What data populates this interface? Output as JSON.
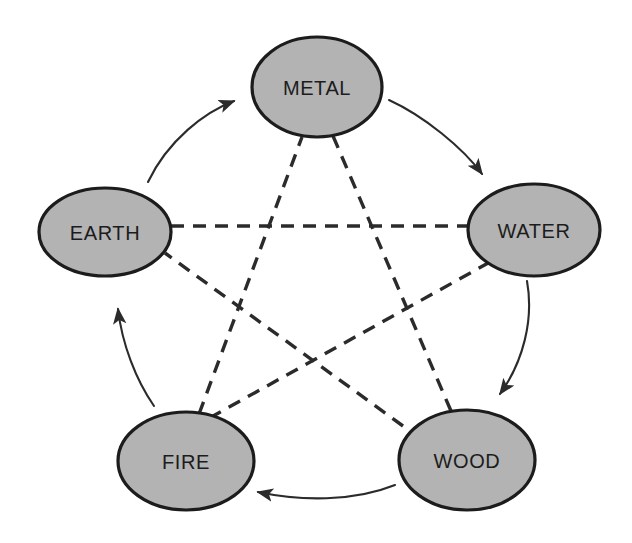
{
  "diagram": {
    "background_color": "#ffffff",
    "node_fill_color": "#b3b3b3",
    "node_stroke_color": "#1c1c1c",
    "label_color": "#1c1c1c",
    "arrow_color": "#2b2b2b",
    "dashed_line_color": "#2b2b2b",
    "dash_pattern": "13 9",
    "nodes": [
      {
        "id": "metal",
        "label": "METAL",
        "cx": 317,
        "cy": 87,
        "rx": 65,
        "ry": 50
      },
      {
        "id": "water",
        "label": "WATER",
        "cx": 534,
        "cy": 230,
        "rx": 66,
        "ry": 46
      },
      {
        "id": "wood",
        "label": "WOOD",
        "cx": 467,
        "cy": 460,
        "rx": 68,
        "ry": 50
      },
      {
        "id": "fire",
        "label": "FIRE",
        "cx": 186,
        "cy": 461,
        "rx": 68,
        "ry": 49
      },
      {
        "id": "earth",
        "label": "EARTH",
        "cx": 105,
        "cy": 232,
        "rx": 66,
        "ry": 44
      }
    ],
    "generating_cycle": {
      "name": "generating cycle",
      "style": "solid curved arrow",
      "edges": [
        {
          "id": "earth-metal",
          "from": "EARTH",
          "to": "METAL",
          "path": "M 148 182 C 168 140 205 112 234 101"
        },
        {
          "id": "metal-water",
          "from": "METAL",
          "to": "WATER",
          "path": "M 389 100 C 424 116 463 148 482 174"
        },
        {
          "id": "water-wood",
          "from": "WATER",
          "to": "WOOD",
          "path": "M 527 281 C 534 320 523 362 500 394"
        },
        {
          "id": "wood-fire",
          "from": "WOOD",
          "to": "FIRE",
          "path": "M 395 485 C 353 502 300 501 258 492"
        },
        {
          "id": "fire-earth",
          "from": "FIRE",
          "to": "EARTH",
          "path": "M 154 406 C 136 380 122 344 118 309"
        }
      ]
    },
    "overcoming_cycle": {
      "name": "overcoming cycle",
      "style": "dashed straight line",
      "edges": [
        {
          "id": "metal-wood",
          "from": "METAL",
          "to": "WOOD",
          "x1": 333,
          "y1": 136,
          "x2": 451,
          "y2": 411
        },
        {
          "id": "wood-earth",
          "from": "WOOD",
          "to": "EARTH",
          "x1": 403,
          "y1": 426,
          "x2": 165,
          "y2": 253
        },
        {
          "id": "earth-water",
          "from": "EARTH",
          "to": "WATER",
          "x1": 171,
          "y1": 226,
          "x2": 468,
          "y2": 226
        },
        {
          "id": "water-fire",
          "from": "WATER",
          "to": "FIRE",
          "x1": 490,
          "y1": 262,
          "x2": 213,
          "y2": 416
        },
        {
          "id": "fire-metal",
          "from": "FIRE",
          "to": "METAL",
          "x1": 199,
          "y1": 414,
          "x2": 302,
          "y2": 137
        }
      ]
    }
  }
}
